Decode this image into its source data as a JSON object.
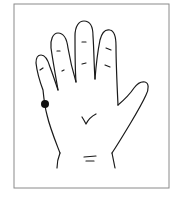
{
  "figure": {
    "marker": {
      "label": "acupoint",
      "location": "outer edge of hand below little finger",
      "color": "#111111"
    },
    "colors": {
      "background": "#ffffff",
      "border": "#8a8a8a",
      "stroke": "#1a1a1a"
    }
  }
}
